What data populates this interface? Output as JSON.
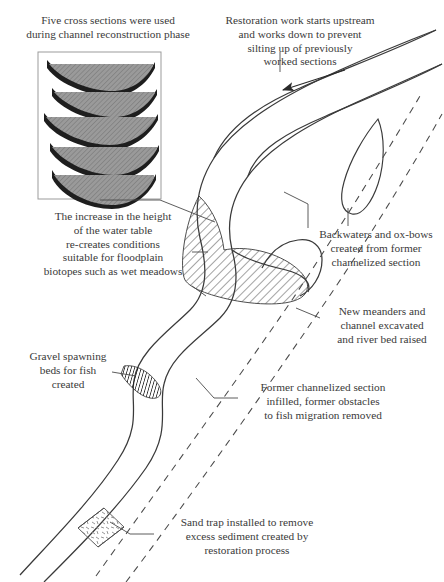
{
  "diagram": {
    "background_color": "#ffffff",
    "ink_color": "#3a3a3a",
    "hatch_color": "#555555"
  },
  "captions": {
    "cross_sections": "Five cross sections were used\nduring channel reconstruction phase",
    "restoration_work": "Restoration work starts upstream\nand works down to prevent\nsilting up of previously\nworked sections",
    "water_table": "The increase in the height\nof the water table\nre-creates conditions\nsuitable for floodplain\nbiotopes such as wet meadows",
    "backwaters": "Backwaters and ox-bows\ncreated from former\nchannelized section",
    "new_meanders": "New meanders and\nchannel excavated\nand river bed raised",
    "former_channel": "Former channelized section\ninfilled, former obstacles\nto fish migration removed",
    "gravel_beds": "Gravel spawning\nbeds for fish\ncreated",
    "sand_trap": "Sand trap installed to remove\nexcess sediment created by\nrestoration process"
  },
  "inset": {
    "name": "cross-section-inset",
    "cross_section_count": 5,
    "bank_color": "#1e1e1e",
    "water_fill_color": "#8f8f8f"
  },
  "features": {
    "flow_arrow": "flow-direction-arrow",
    "oxbow": "ox-bow-island",
    "floodplain": "hatched-floodplain-area",
    "gravel_bed": "gravel-spawning-bed",
    "sand_trap_box": "sand-trap",
    "channelized_line_style": "dashed"
  }
}
